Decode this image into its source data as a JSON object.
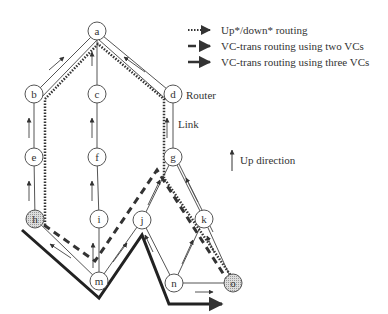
{
  "legend": {
    "items": [
      {
        "style": "dotted",
        "label": "Up*/down* routing"
      },
      {
        "style": "dashed",
        "label": "VC-trans routing using two VCs"
      },
      {
        "style": "solid-thick",
        "label": "VC-trans routing using three VCs"
      }
    ],
    "up_direction": "Up direction"
  },
  "labels": {
    "router": "Router",
    "link": "Link"
  },
  "nodes": [
    {
      "id": "a",
      "x": 97,
      "y": 31
    },
    {
      "id": "b",
      "x": 34,
      "y": 94
    },
    {
      "id": "c",
      "x": 97,
      "y": 94
    },
    {
      "id": "d",
      "x": 173,
      "y": 94
    },
    {
      "id": "e",
      "x": 34,
      "y": 157
    },
    {
      "id": "f",
      "x": 97,
      "y": 157
    },
    {
      "id": "g",
      "x": 173,
      "y": 157
    },
    {
      "id": "h",
      "x": 35,
      "y": 219,
      "shaded": true
    },
    {
      "id": "i",
      "x": 99,
      "y": 219
    },
    {
      "id": "j",
      "x": 142,
      "y": 220
    },
    {
      "id": "k",
      "x": 204,
      "y": 219
    },
    {
      "id": "m",
      "x": 99,
      "y": 281
    },
    {
      "id": "n",
      "x": 174,
      "y": 283
    },
    {
      "id": "o",
      "x": 233,
      "y": 283,
      "shaded": true
    }
  ],
  "colors": {
    "line": "#555555",
    "thick": "#222222",
    "shade": "#bbbbbb"
  }
}
